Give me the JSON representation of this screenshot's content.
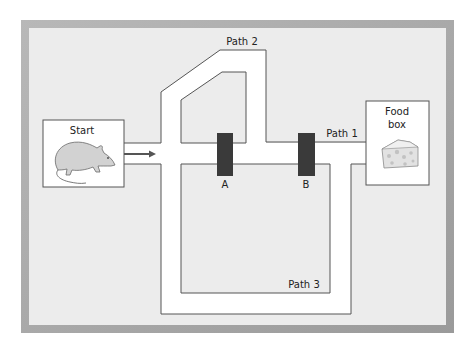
{
  "figure": {
    "labels": {
      "start": "Start",
      "food_box_line1": "Food",
      "food_box_line2": "box",
      "path1": "Path 1",
      "path2": "Path 2",
      "path3": "Path 3",
      "gate_a": "A",
      "gate_b": "B"
    },
    "icons": {
      "start_animal": "rat-icon",
      "food": "cheese-icon",
      "direction": "arrow-right-icon"
    },
    "colors": {
      "frame_border": "#a8a8a8",
      "frame_fill": "#ececec",
      "corridor_fill": "#ffffff",
      "wall_stroke": "#555555",
      "gate_fill": "#3a3a3a",
      "arrow": "#555555"
    }
  }
}
